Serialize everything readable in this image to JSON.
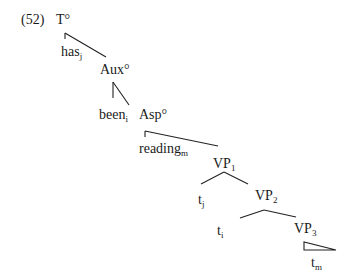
{
  "example_number": "(52)",
  "nodes": {
    "T": {
      "label": "T°"
    },
    "has": {
      "label": "has",
      "sub": "j"
    },
    "Aux": {
      "label": "Aux°"
    },
    "been": {
      "label": "been",
      "sub": "i"
    },
    "Asp": {
      "label": "Asp°"
    },
    "reading": {
      "label": "reading",
      "sub": "m"
    },
    "VP1": {
      "label": "VP",
      "sub": "1"
    },
    "tj": {
      "label": "t",
      "sub": "j"
    },
    "VP2": {
      "label": "VP",
      "sub": "2"
    },
    "ti": {
      "label": "t",
      "sub": "i"
    },
    "VP3": {
      "label": "VP",
      "sub": "3"
    },
    "tm": {
      "label": "t",
      "sub": "m"
    }
  }
}
